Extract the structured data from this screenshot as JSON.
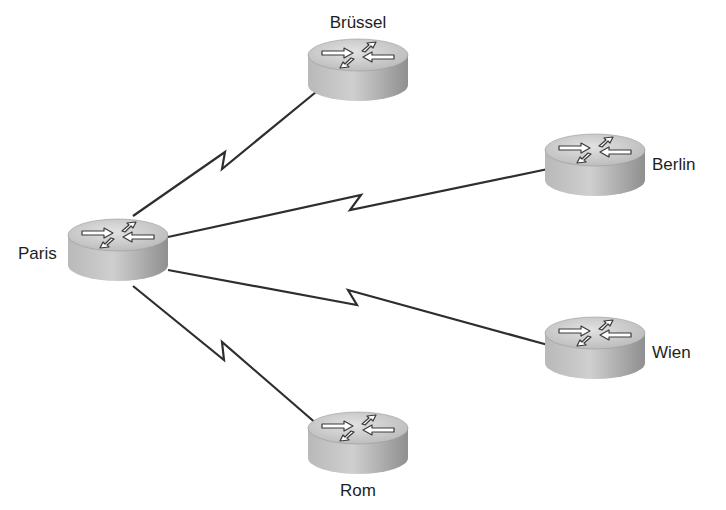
{
  "diagram": {
    "type": "network-topology",
    "topology": "hub-and-spoke",
    "link_type": "serial (WAN, lightning-bolt symbol)",
    "hub": "Paris",
    "nodes": [
      {
        "id": "paris",
        "label": "Paris",
        "device": "router",
        "cx": 118,
        "cy": 235,
        "label_x": 18,
        "label_y": 259,
        "label_anchor": "start"
      },
      {
        "id": "brussel",
        "label": "Brüssel",
        "device": "router",
        "cx": 358,
        "cy": 55,
        "label_x": 358,
        "label_y": 28,
        "label_anchor": "middle"
      },
      {
        "id": "berlin",
        "label": "Berlin",
        "device": "router",
        "cx": 595,
        "cy": 150,
        "label_x": 652,
        "label_y": 170,
        "label_anchor": "start"
      },
      {
        "id": "wien",
        "label": "Wien",
        "device": "router",
        "cx": 595,
        "cy": 333,
        "label_x": 652,
        "label_y": 358,
        "label_anchor": "start"
      },
      {
        "id": "rom",
        "label": "Rom",
        "device": "router",
        "cx": 358,
        "cy": 428,
        "label_x": 358,
        "label_y": 496,
        "label_anchor": "middle"
      }
    ],
    "links": [
      {
        "from": "Paris",
        "to": "Brüssel",
        "kind": "serial"
      },
      {
        "from": "Paris",
        "to": "Berlin",
        "kind": "serial"
      },
      {
        "from": "Paris",
        "to": "Wien",
        "kind": "serial"
      },
      {
        "from": "Paris",
        "to": "Rom",
        "kind": "serial"
      }
    ],
    "colors": {
      "background": "#ffffff",
      "link": "#2e2e2e",
      "router_top": "#c9c9c9",
      "router_side": "#a8a8a8",
      "label": "#1e1e1e"
    }
  }
}
